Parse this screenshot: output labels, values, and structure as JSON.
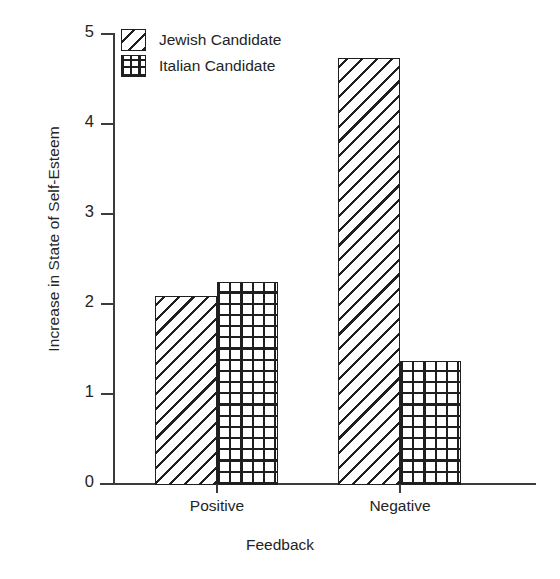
{
  "chart_data": {
    "type": "bar",
    "title": "",
    "subtitle": "",
    "xlabel": "Feedback",
    "ylabel": "Increase in State of Self-Esteem",
    "categories": [
      "Positive",
      "Negative"
    ],
    "series": [
      {
        "name": "Jewish Candidate",
        "pattern": "diagonal-hatch",
        "values": [
          2.08,
          4.72
        ]
      },
      {
        "name": "Italian Candidate",
        "pattern": "crosshatch-grid",
        "values": [
          2.23,
          1.36
        ]
      }
    ],
    "ylim": [
      0,
      5
    ],
    "yticks": [
      0,
      1,
      2,
      3,
      4,
      5
    ],
    "ytick_labels": [
      "0",
      "1",
      "2",
      "3",
      "4",
      "5"
    ],
    "grid": false,
    "legend_position": "top-left-inside",
    "colors": {
      "ink": "#1f1f1f",
      "axis": "#3b3b3b",
      "background": "#ffffff"
    }
  },
  "legend": {
    "items": [
      {
        "label": "Jewish Candidate",
        "swatch": "diagonal-hatch-swatch"
      },
      {
        "label": "Italian Candidate",
        "swatch": "crosshatch-grid-swatch"
      }
    ]
  },
  "axes": {
    "y": {
      "label": "Increase in State of Self-Esteem",
      "ticks": [
        "0",
        "1",
        "2",
        "3",
        "4",
        "5"
      ]
    },
    "x": {
      "label": "Feedback",
      "ticks": [
        "Positive",
        "Negative"
      ]
    }
  }
}
